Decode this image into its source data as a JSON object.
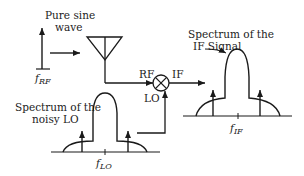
{
  "diagram": {
    "type": "block diagram of RF mixer with noisy local oscillator",
    "labels": {
      "pure_sine_line1": "Pure sine",
      "pure_sine_line2": "wave",
      "f_rf_main": "f",
      "f_rf_sub": "RF",
      "rf_port": "RF",
      "if_port": "IF",
      "lo_port": "LO",
      "if_spectrum_line1": "Spectrum of the",
      "if_spectrum_line2": "IF Signal",
      "lo_spectrum_line1": "Spectrum of the",
      "lo_spectrum_line2": "noisy LO",
      "f_lo_main": "f",
      "f_lo_sub": "LO",
      "f_if_main": "f",
      "f_if_sub": "IF"
    },
    "components": [
      "rf-tone-arrow",
      "antenna",
      "mixer",
      "if-spectrum",
      "lo-spectrum"
    ],
    "colors": {
      "stroke": "#1a1a1a",
      "background": "#ffffff"
    }
  }
}
